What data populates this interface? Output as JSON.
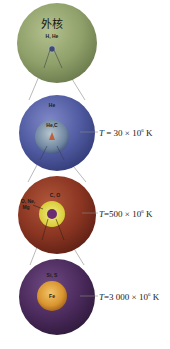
{
  "diagram": {
    "stages": [
      {
        "id": "outer",
        "title_label": "外核",
        "shell_label": "H, He",
        "sphere_color": "#8fa06a",
        "core_color": "#3d4a73",
        "temperature": null
      },
      {
        "id": "helium",
        "shell_label": "He",
        "core_label": "He,C",
        "sphere_color": "#4f5aa0",
        "core_color": "#7a8fa8",
        "temperature": {
          "prefix": "T",
          "equals": " = 30 × 10",
          "exp": "6",
          "unit": " K"
        }
      },
      {
        "id": "carbon",
        "shell_label": "C, O",
        "side_label_line1": "O, Ne,",
        "side_label_line2": "Mg",
        "sphere_color": "#8a3522",
        "core_color": "#e3d94a",
        "temperature": {
          "prefix": "T",
          "equals": "=500 × 10",
          "exp": "6",
          "unit": " K"
        }
      },
      {
        "id": "silicon",
        "shell_label": "Si, S",
        "core_label": "Fe",
        "sphere_color": "#4b2a5c",
        "core_color": "#d9952f",
        "temperature": {
          "prefix": "T",
          "equals": "=3 000 × 10",
          "exp": "6",
          "unit": " K"
        }
      }
    ]
  }
}
